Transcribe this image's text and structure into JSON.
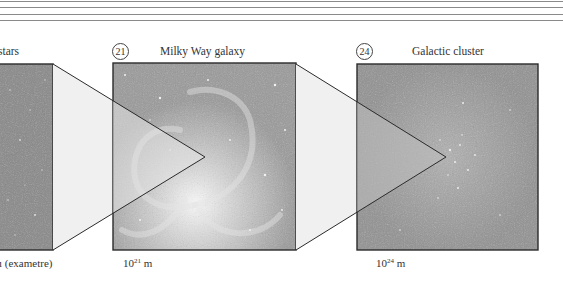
{
  "header": {
    "rules": [
      1,
      7,
      14,
      20
    ]
  },
  "panels": [
    {
      "id": "stars",
      "number": "",
      "title": "stars",
      "scale_text": "1 (exametre)",
      "scale_visible": "ı (exametre)",
      "color": "#8e8e8e"
    },
    {
      "id": "milky-way",
      "number": "21",
      "title": "Milky Way galaxy",
      "scale_base": "10",
      "scale_exp": "21",
      "scale_unit": "m",
      "color": "#a9a9a9"
    },
    {
      "id": "galactic-cluster",
      "number": "24",
      "title": "Galactic cluster",
      "scale_base": "10",
      "scale_exp": "24",
      "scale_unit": "m",
      "color": "#9a9a9a"
    }
  ],
  "colors": {
    "frame": "#2b2b2b",
    "funnel_fill": "#f0f0f0",
    "rule": "#8a8a8a"
  }
}
